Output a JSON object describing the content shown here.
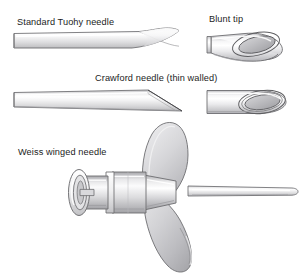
{
  "figure": {
    "background_color": "#ffffff",
    "ink_color": "#1c1c1c",
    "width": 304,
    "height": 276
  },
  "labels": {
    "tuohy": "Standard Tuohy needle",
    "blunt_tip": "Blunt tip",
    "crawford": "Crawford needle (thin walled)",
    "weiss": "Weiss winged needle"
  },
  "illustrations": [
    {
      "name": "standard-tuohy-needle",
      "label": "Standard Tuohy needle",
      "tip_style": "curved Huber point",
      "view": "side profile, shaft running left to right with upturned tip"
    },
    {
      "name": "blunt-tip-detail",
      "label": "Blunt tip",
      "tip_style": "blunt angled opening",
      "view": "enlarged oblique detail showing elliptical lumen"
    },
    {
      "name": "crawford-needle",
      "label": "Crawford needle (thin walled)",
      "tip_style": "short straight bevel",
      "view": "side profile, shaft running left to right with straight bevel"
    },
    {
      "name": "crawford-tip-detail",
      "label": "",
      "tip_style": "thin walled bevel opening",
      "view": "enlarged oblique detail showing elliptical lumen"
    },
    {
      "name": "weiss-winged-needle",
      "label": "Weiss winged needle",
      "tip_style": "winged hub with luer lock connector",
      "view": "three-quarter view of hub, wings and shaft"
    }
  ],
  "palette": {
    "outline": "#58585a",
    "outline_dark": "#3a3a3c",
    "metal_light": "#fdfdfd",
    "metal_mid": "#d8d8da",
    "metal_shadow": "#a9a9ac",
    "lumen_fill": "#b8b8bb",
    "wing_fill": "#c9c9cc",
    "wing_shadow": "#9c9ca0"
  }
}
